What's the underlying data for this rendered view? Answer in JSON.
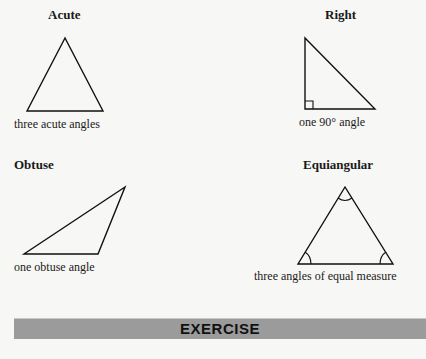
{
  "triangles": {
    "acute": {
      "title": "Acute",
      "caption": "three acute angles"
    },
    "right": {
      "title": "Right",
      "caption": "one 90° angle"
    },
    "obtuse": {
      "title": "Obtuse",
      "caption": "one obtuse angle"
    },
    "equiangular": {
      "title": "Equiangular",
      "caption": "three angles of equal measure"
    }
  },
  "section_bar": {
    "label": "EXERCISE",
    "color": "#9b9b9b"
  }
}
